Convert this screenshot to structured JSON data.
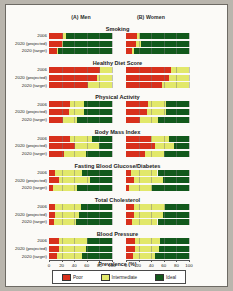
{
  "panels": [
    {
      "id": "men",
      "label": "(A) Men"
    },
    {
      "id": "women",
      "label": "(B) Women"
    }
  ],
  "row_labels": [
    "2006",
    "2020 (projected)",
    "2020 (target)"
  ],
  "axis": {
    "xlabel": "Prevalence (%)",
    "ticks": [
      0,
      20,
      40,
      60,
      80,
      100
    ],
    "xlim": [
      0,
      100
    ]
  },
  "legend": {
    "position": "bottom",
    "entries": [
      {
        "label": "Poor",
        "color": "#d8301c"
      },
      {
        "label": "Intermediate",
        "color": "#e2e86a"
      },
      {
        "label": "Ideal",
        "color": "#12591c"
      }
    ]
  },
  "colors": {
    "poor": "#d8301c",
    "intermediate": "#e2e86a",
    "ideal": "#12591c"
  },
  "chart_data": {
    "type": "bar",
    "orientation": "horizontal",
    "stacked": true,
    "title": "",
    "xlabel": "Prevalence (%)",
    "ylabel": "",
    "xlim": [
      0,
      100
    ],
    "grid": true,
    "categories": [
      "2006",
      "2020 (projected)",
      "2020 (target)"
    ],
    "series": [
      {
        "name": "Poor",
        "color": "#d8301c"
      },
      {
        "name": "Intermediate",
        "color": "#e2e86a"
      },
      {
        "name": "Ideal",
        "color": "#12591c"
      }
    ],
    "sections": [
      {
        "title": "Smoking",
        "men": [
          [
            22,
            5,
            73
          ],
          [
            20,
            3,
            77
          ],
          [
            12,
            2,
            86
          ]
        ],
        "women": [
          [
            18,
            5,
            77
          ],
          [
            16,
            8,
            76
          ],
          [
            10,
            2,
            88
          ]
        ]
      },
      {
        "title": "Healthy Diet Score",
        "men": [
          [
            81,
            19,
            0
          ],
          [
            76,
            24,
            0
          ],
          [
            62,
            38,
            0
          ]
        ],
        "women": [
          [
            72,
            28,
            0
          ],
          [
            68,
            32,
            0
          ],
          [
            57,
            43,
            0
          ]
        ]
      },
      {
        "title": "Physical Activity",
        "men": [
          [
            33,
            22,
            45
          ],
          [
            31,
            24,
            45
          ],
          [
            22,
            22,
            56
          ]
        ],
        "women": [
          [
            35,
            28,
            37
          ],
          [
            33,
            30,
            37
          ],
          [
            23,
            28,
            49
          ]
        ]
      },
      {
        "title": "Body Mass Index",
        "men": [
          [
            33,
            36,
            31
          ],
          [
            42,
            37,
            21
          ],
          [
            24,
            34,
            42
          ]
        ],
        "women": [
          [
            39,
            30,
            31
          ],
          [
            46,
            30,
            24
          ],
          [
            30,
            30,
            40
          ]
        ]
      },
      {
        "title": "Fasting Blood Glucose/Diabetes",
        "men": [
          [
            9,
            44,
            47
          ],
          [
            16,
            49,
            35
          ],
          [
            6,
            38,
            56
          ]
        ],
        "women": [
          [
            8,
            42,
            50
          ],
          [
            13,
            46,
            41
          ],
          [
            5,
            36,
            59
          ]
        ]
      },
      {
        "title": "Total Cholesterol",
        "men": [
          [
            10,
            41,
            49
          ],
          [
            10,
            38,
            52
          ],
          [
            8,
            35,
            57
          ]
        ],
        "women": [
          [
            12,
            50,
            38
          ],
          [
            12,
            46,
            42
          ],
          [
            9,
            41,
            50
          ]
        ]
      },
      {
        "title": "Blood Pressure",
        "men": [
          [
            16,
            44,
            40
          ],
          [
            16,
            43,
            41
          ],
          [
            12,
            40,
            48
          ]
        ],
        "women": [
          [
            14,
            40,
            46
          ],
          [
            15,
            38,
            47
          ],
          [
            11,
            35,
            54
          ]
        ]
      }
    ]
  }
}
